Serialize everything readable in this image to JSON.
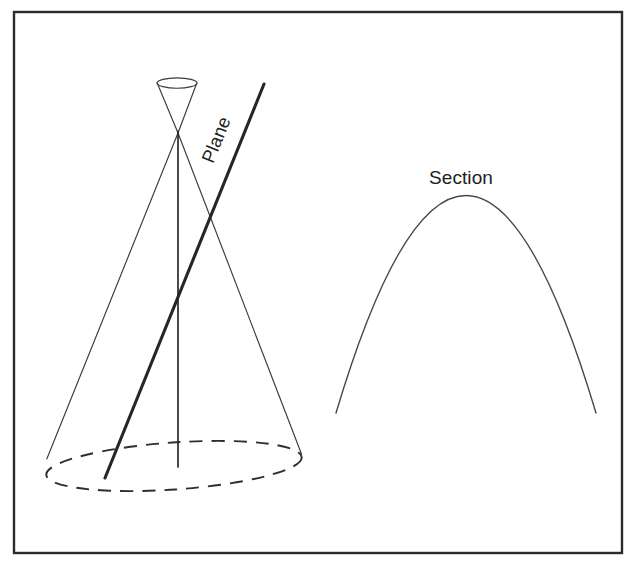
{
  "figure": {
    "name": "conic-section-parabola-diagram",
    "background_color": "#ffffff",
    "border_color": "#2b2b2b",
    "line_color": "#3a3a3a",
    "accent_color": "#262626",
    "width": 637,
    "height": 575
  },
  "labels": {
    "plane": "Plane",
    "section": "Section"
  },
  "geometry": {
    "frame": {
      "x": 14,
      "y": 12,
      "width": 608,
      "height": 541
    },
    "cone": {
      "apex": {
        "x": 178,
        "y": 133
      },
      "axis_bottom": {
        "x": 178,
        "y": 467
      },
      "base_ellipse": {
        "cx": 174,
        "cy": 466,
        "rx": 128,
        "ry": 24,
        "rotation": -4,
        "style": "dashed"
      },
      "top_ellipse": {
        "cx": 177,
        "cy": 83,
        "rx": 20,
        "ry": 5,
        "style": "solid"
      },
      "left_slant": {
        "x1": 178,
        "y1": 133,
        "x2": 47,
        "y2": 459
      },
      "right_slant": {
        "x1": 178,
        "y1": 133,
        "x2": 301,
        "y2": 455
      },
      "upper_nappe_left": {
        "x1": 178,
        "y1": 133,
        "x2": 157,
        "y2": 83
      },
      "upper_nappe_right": {
        "x1": 178,
        "y1": 133,
        "x2": 197,
        "y2": 83
      }
    },
    "plane": {
      "start": {
        "x": 105,
        "y": 478
      },
      "end": {
        "x": 264,
        "y": 84
      },
      "label_anchor": {
        "x": 222,
        "y": 142
      },
      "label_rotation": -68
    },
    "section": {
      "type": "parabola",
      "vertex": {
        "x": 466,
        "y": 196
      },
      "left_end": {
        "x": 336,
        "y": 413
      },
      "right_end": {
        "x": 596,
        "y": 413
      },
      "label_anchor": {
        "x": 461,
        "y": 184
      }
    }
  }
}
